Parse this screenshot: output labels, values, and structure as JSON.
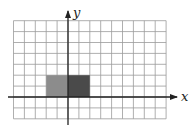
{
  "diagram": {
    "type": "coordinate-grid",
    "axes": {
      "x_label": "x",
      "y_label": "y"
    },
    "grid": {
      "columns": 14,
      "rows": 9,
      "x_range": [
        -5,
        9
      ],
      "y_range": [
        -2,
        7
      ]
    },
    "shapes": [
      {
        "name": "left-rectangle",
        "x0": -2,
        "x1": 0,
        "y0": 0,
        "y1": 2,
        "color": "#8c8c8c"
      },
      {
        "name": "right-rectangle",
        "x0": 0,
        "x1": 2,
        "y0": 0,
        "y1": 2,
        "color": "#4a4a4a"
      }
    ],
    "colors": {
      "grid": "#9a9a9a",
      "axis": "#222222"
    }
  }
}
